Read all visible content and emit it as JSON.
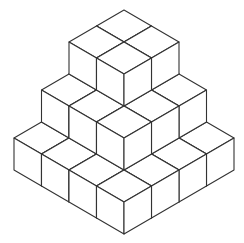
{
  "diagram": {
    "layers": [
      {
        "level": 0,
        "size": 4
      },
      {
        "level": 1,
        "size": 3
      },
      {
        "level": 2,
        "size": 2
      }
    ],
    "total_cubes": 29,
    "stroke_color": "#333333",
    "fill_color": "#ffffff"
  }
}
